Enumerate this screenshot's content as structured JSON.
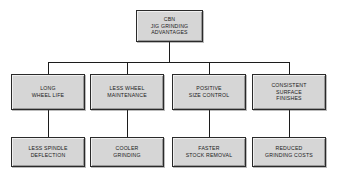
{
  "diagram": {
    "title": "CBN Jig Grinding Advantages",
    "type": "organizational-flowchart",
    "background_color": "#ffffff",
    "box_fill_color": "#d6d6d6",
    "box_border_color": "#2a2a2a",
    "line_color": "#1c1c1c",
    "text_color": "#1a1a1a",
    "root": {
      "id": "cbn-jig-grinding-advantages",
      "text": "CBN\nJIG GRINDING\nADVANTAGES",
      "lines": [
        "CBN",
        "JIG GRINDING",
        "ADVANTAGES"
      ]
    },
    "level2": [
      {
        "id": "long-wheel-life",
        "text": "LONG\nWHEEL LIFE",
        "lines": [
          "LONG",
          "WHEEL LIFE"
        ]
      },
      {
        "id": "less-wheel-maintenance",
        "text": "LESS WHEEL\nMAINTENANCE",
        "lines": [
          "LESS WHEEL",
          "MAINTENANCE"
        ]
      },
      {
        "id": "positive-size-control",
        "text": "POSITIVE\nSIZE CONTROL",
        "lines": [
          "POSITIVE",
          "SIZE CONTROL"
        ]
      },
      {
        "id": "consistent-surface-finishes",
        "text": "CONSISTENT\nSURFACE\nFINISHES",
        "lines": [
          "CONSISTENT",
          "SURFACE",
          "FINISHES"
        ]
      }
    ],
    "level3": [
      {
        "id": "less-spindle-deflection",
        "text": "LESS SPINDLE\nDEFLECTION",
        "lines": [
          "LESS SPINDLE",
          "DEFLECTION"
        ]
      },
      {
        "id": "cooler-grinding",
        "text": "COOLER\nGRINDING",
        "lines": [
          "COOLER",
          "GRINDING"
        ]
      },
      {
        "id": "faster-stock-removal",
        "text": "FASTER\nSTOCK REMOVAL",
        "lines": [
          "FASTER",
          "STOCK REMOVAL"
        ]
      },
      {
        "id": "reduced-grinding-costs",
        "text": "REDUCED\nGRINDING COSTS",
        "lines": [
          "REDUCED",
          "GRINDING COSTS"
        ]
      }
    ]
  }
}
